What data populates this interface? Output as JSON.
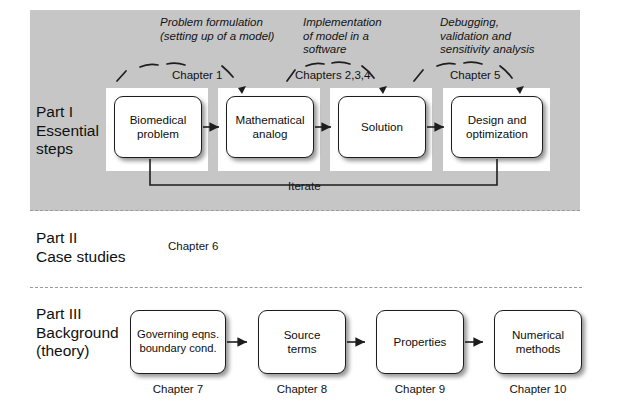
{
  "figure": {
    "parts": [
      {
        "id": "part-1",
        "label": "Part I\nEssential\nsteps",
        "annotations": [
          "Problem formulation\n(setting up of a model)",
          "Implementation\nof model in a\nsoftware",
          "Debugging,\nvalidation and\nsensitivity analysis"
        ],
        "chapter_tags": [
          "Chapter 1",
          "Chapters 2,3,4",
          "Chapter 5"
        ],
        "steps": [
          "Biomedical\nproblem",
          "Mathematical\nanalog",
          "Solution",
          "Design and\noptimization"
        ],
        "feedback_label": "Iterate"
      },
      {
        "id": "part-2",
        "label": "Part II\nCase studies",
        "chapter": "Chapter 6"
      },
      {
        "id": "part-3",
        "label": "Part III\nBackground\n(theory)",
        "steps": [
          "Governing eqns.\nboundary cond.",
          "Source\nterms",
          "Properties",
          "Numerical\nmethods"
        ],
        "chapters": [
          "Chapter 7",
          "Chapter 8",
          "Chapter 9",
          "Chapter 10"
        ]
      }
    ],
    "colors": {
      "band_background": "#c6c6c6",
      "page_background": "#ffffff",
      "box_fill": "#ffffff",
      "box_border": "#1d1d1d",
      "text": "#101010",
      "dashed_separator": "#9a9a9a"
    }
  }
}
